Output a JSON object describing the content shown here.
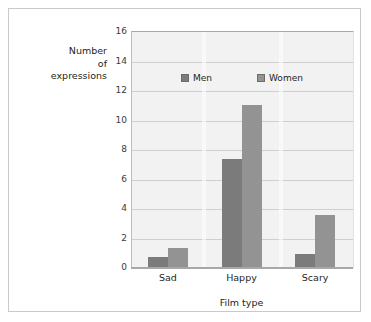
{
  "figure": {
    "y_axis_title_lines": [
      "Number",
      "of",
      "expressions"
    ],
    "x_axis_title": "Film type"
  },
  "legend": {
    "entries": [
      {
        "label": "Men",
        "color": "#7b7b7b"
      },
      {
        "label": "Women",
        "color": "#939393"
      }
    ]
  },
  "chart_data": {
    "type": "bar",
    "title": "",
    "subtitle": "",
    "xlabel": "Film type",
    "ylabel": "Number of expressions",
    "categories": [
      "Sad",
      "Happy",
      "Scary"
    ],
    "series": [
      {
        "name": "Men",
        "color": "#7b7b7b",
        "values": [
          0.7,
          7.3,
          0.85
        ]
      },
      {
        "name": "Women",
        "color": "#939393",
        "values": [
          1.3,
          11.0,
          3.5
        ]
      }
    ],
    "ylim": [
      0,
      16
    ],
    "ytick_step": 2,
    "ytick_labels": [
      "0",
      "2",
      "4",
      "6",
      "8",
      "10",
      "12",
      "14",
      "16"
    ],
    "grid": "horizontal",
    "legend_position": "inside-top-center",
    "plot_background": "#f2f2f2",
    "gridline_color": "#cfcfd2",
    "figure_border_color": "#c9c9cc"
  }
}
